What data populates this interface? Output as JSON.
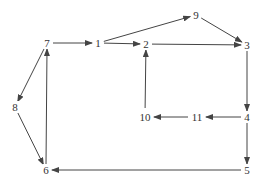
{
  "diagram": {
    "type": "directed-graph",
    "colors": {
      "edge": "#444444",
      "text": "#333333",
      "background": "#ffffff"
    },
    "nodes": [
      {
        "id": "1",
        "label": "1",
        "x": 98,
        "y": 43
      },
      {
        "id": "2",
        "label": "2",
        "x": 146,
        "y": 44
      },
      {
        "id": "3",
        "label": "3",
        "x": 247,
        "y": 45
      },
      {
        "id": "4",
        "label": "4",
        "x": 247,
        "y": 117
      },
      {
        "id": "5",
        "label": "5",
        "x": 247,
        "y": 170
      },
      {
        "id": "6",
        "label": "6",
        "x": 46,
        "y": 170
      },
      {
        "id": "7",
        "label": "7",
        "x": 47,
        "y": 43
      },
      {
        "id": "8",
        "label": "8",
        "x": 15,
        "y": 107
      },
      {
        "id": "9",
        "label": "9",
        "x": 196,
        "y": 15
      },
      {
        "id": "10",
        "label": "10",
        "x": 145,
        "y": 117
      },
      {
        "id": "11",
        "label": "11",
        "x": 197,
        "y": 117
      }
    ],
    "edges": [
      {
        "from": "7",
        "to": "1"
      },
      {
        "from": "1",
        "to": "2"
      },
      {
        "from": "1",
        "to": "9"
      },
      {
        "from": "9",
        "to": "3"
      },
      {
        "from": "2",
        "to": "3"
      },
      {
        "from": "3",
        "to": "4"
      },
      {
        "from": "4",
        "to": "11"
      },
      {
        "from": "11",
        "to": "10"
      },
      {
        "from": "10",
        "to": "2"
      },
      {
        "from": "4",
        "to": "5"
      },
      {
        "from": "5",
        "to": "6"
      },
      {
        "from": "6",
        "to": "7"
      },
      {
        "from": "7",
        "to": "8"
      },
      {
        "from": "8",
        "to": "6"
      }
    ]
  }
}
